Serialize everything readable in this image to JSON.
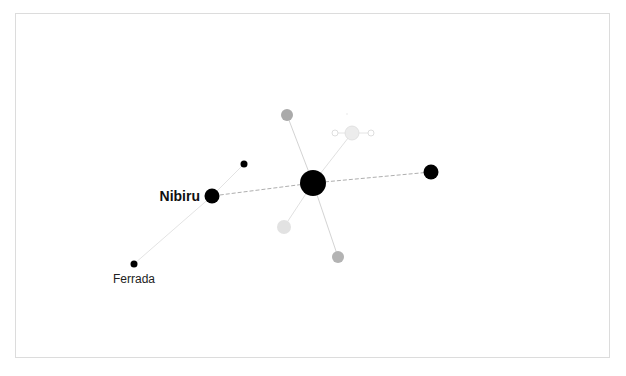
{
  "caption": "",
  "graph": {
    "nodes": [
      {
        "id": "hub",
        "label": "",
        "x": 313,
        "y": 183,
        "r": 13,
        "fill": "#000000"
      },
      {
        "id": "right",
        "label": "",
        "x": 431,
        "y": 172,
        "r": 7.5,
        "fill": "#000000"
      },
      {
        "id": "nibiru",
        "label": "Nibiru",
        "x": 212,
        "y": 196,
        "r": 7.5,
        "fill": "#000000"
      },
      {
        "id": "small-top",
        "label": "",
        "x": 244,
        "y": 164,
        "r": 3.5,
        "fill": "#000000"
      },
      {
        "id": "ferrada",
        "label": "Ferrada",
        "x": 134,
        "y": 264,
        "r": 3.5,
        "fill": "#000000"
      },
      {
        "id": "grey-top",
        "label": "",
        "x": 287,
        "y": 115,
        "r": 6,
        "fill": "#aaaaaa"
      },
      {
        "id": "light-bottom-left",
        "label": "",
        "x": 284,
        "y": 227,
        "r": 7,
        "fill": "#e0e0e0"
      },
      {
        "id": "grey-bottom",
        "label": "",
        "x": 338,
        "y": 257,
        "r": 6,
        "fill": "#b3b3b3"
      },
      {
        "id": "light-top-right",
        "label": "",
        "x": 352,
        "y": 133,
        "r": 7,
        "fill": "#ececec"
      },
      {
        "id": "ring-left",
        "label": "",
        "x": 335,
        "y": 133,
        "r": 3,
        "fill": "#ffffff"
      },
      {
        "id": "ring-right",
        "label": "",
        "x": 371,
        "y": 133,
        "r": 3,
        "fill": "#ffffff"
      }
    ],
    "labels": {
      "nibiru": "Nibiru",
      "ferrada": "Ferrada"
    }
  }
}
